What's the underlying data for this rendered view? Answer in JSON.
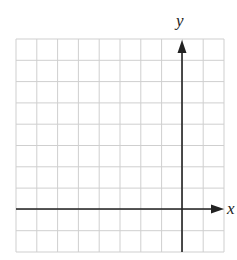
{
  "header": {
    "fragment_text": ""
  },
  "diagram": {
    "type": "coordinate-grid",
    "columns": 10,
    "rows": 10,
    "x_axis_label": "x",
    "y_axis_label": "y",
    "y_axis_column": 8,
    "x_axis_row": 8,
    "colors": {
      "grid": "#cfcfcf",
      "axis": "#222222",
      "background": "#ffffff"
    }
  }
}
